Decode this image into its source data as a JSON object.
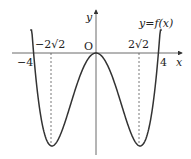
{
  "chart_data": {
    "type": "line",
    "title": "",
    "function_label": "y=f(x)",
    "xlabel": "x",
    "ylabel": "y",
    "origin_label": "O",
    "x_ticks": [
      {
        "value": -4,
        "label": "-4"
      },
      {
        "value": -2.828,
        "label": "-2√2"
      },
      {
        "value": 2.828,
        "label": "2√2"
      },
      {
        "value": 4,
        "label": "4"
      }
    ],
    "series": [
      {
        "name": "y=f(x)",
        "description": "even quartic, zeros at x=-4,0,4; local max at (0,0); minima at x=±2√2",
        "x": [
          -4.15,
          -4,
          -2.828,
          0,
          2.828,
          4,
          4.15
        ],
        "shape": "W"
      }
    ],
    "xlim": [
      -4.5,
      5
    ],
    "grid": false
  },
  "labels": {
    "y_axis": "y",
    "x_axis": "x",
    "origin": "O",
    "neg4": "−4",
    "pos4": "4",
    "neg2r2": "−2√2",
    "pos2r2": "2√2",
    "func_y": "y",
    "func_eq": "=",
    "func_f": "f(x)"
  }
}
